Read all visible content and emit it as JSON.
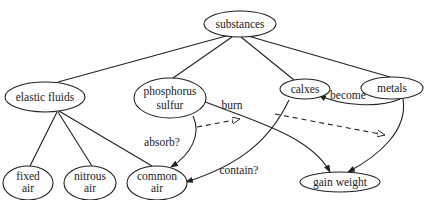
{
  "diagram": {
    "nodes": {
      "substances": {
        "lines": [
          "substances"
        ]
      },
      "elastic_fluids": {
        "lines": [
          "elastic fluids"
        ]
      },
      "phosphorus_sulfur": {
        "lines": [
          "phosphorus",
          "sulfur"
        ]
      },
      "calxes": {
        "lines": [
          "calxes"
        ]
      },
      "metals": {
        "lines": [
          "metals"
        ]
      },
      "fixed_air": {
        "lines": [
          "fixed",
          "air"
        ]
      },
      "nitrous_air": {
        "lines": [
          "nitrous",
          "air"
        ]
      },
      "common_air": {
        "lines": [
          "common",
          "air"
        ]
      },
      "gain_weight": {
        "lines": [
          "gain weight"
        ]
      }
    },
    "edge_labels": {
      "burn": "burn",
      "absorb": "absorb?",
      "contain": "contain?",
      "become": "become"
    },
    "edges": [
      {
        "from": "substances",
        "to": "elastic fluids",
        "style": "solid",
        "arrow": false
      },
      {
        "from": "substances",
        "to": "phosphorus sulfur",
        "style": "solid",
        "arrow": false
      },
      {
        "from": "substances",
        "to": "calxes",
        "style": "solid",
        "arrow": false
      },
      {
        "from": "substances",
        "to": "metals",
        "style": "solid",
        "arrow": false
      },
      {
        "from": "elastic fluids",
        "to": "fixed air",
        "style": "solid",
        "arrow": false
      },
      {
        "from": "elastic fluids",
        "to": "nitrous air",
        "style": "solid",
        "arrow": false
      },
      {
        "from": "elastic fluids",
        "to": "common air",
        "style": "solid",
        "arrow": false
      },
      {
        "from": "phosphorus sulfur",
        "to": "common air",
        "label": "absorb?",
        "style": "solid",
        "arrow": true
      },
      {
        "from": "phosphorus sulfur",
        "to": "gain weight",
        "label": "burn",
        "style": "solid",
        "arrow": true
      },
      {
        "from": "calxes",
        "to": "common air",
        "label": "contain?",
        "style": "solid",
        "arrow": true
      },
      {
        "from": "metals",
        "to": "calxes",
        "label": "become",
        "style": "solid",
        "arrow": true
      },
      {
        "from": "metals",
        "to": "gain weight",
        "style": "solid",
        "arrow": true
      },
      {
        "from": "absorb? edge",
        "to": "burn edge",
        "style": "dashed",
        "arrow": "open"
      },
      {
        "from": "contain? edge",
        "to": "metals-gain weight edge",
        "style": "dashed",
        "arrow": "open"
      }
    ]
  }
}
